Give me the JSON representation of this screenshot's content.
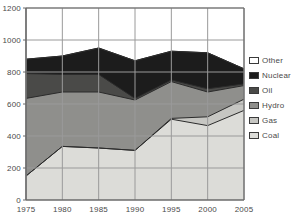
{
  "chart_data": {
    "type": "area",
    "stacked": true,
    "title": "",
    "subtitle": "",
    "xlabel": "",
    "ylabel": "",
    "categories": [
      1975,
      1980,
      1985,
      1990,
      1995,
      2000,
      2005
    ],
    "x_tick_labels": [
      "1975",
      "1980",
      "1985",
      "1990",
      "1995",
      "2000",
      "2005"
    ],
    "y_tick_labels": [
      "0",
      "200",
      "400",
      "600",
      "800",
      "1000",
      "1200"
    ],
    "y_ticks": [
      0,
      200,
      400,
      600,
      800,
      1000,
      1200
    ],
    "ylim": [
      0,
      1200
    ],
    "xlim": [
      1975,
      2005
    ],
    "grid": true,
    "legend_position": "right",
    "series": [
      {
        "name": "Coal",
        "color": "#dcdcd8",
        "values": [
          150,
          335,
          325,
          310,
          505,
          465,
          560
        ]
      },
      {
        "name": "Gas",
        "color": "#c6c6c2",
        "values": [
          0,
          0,
          0,
          0,
          5,
          55,
          70
        ]
      },
      {
        "name": "Hydro",
        "color": "#8f8f8c",
        "values": [
          485,
          340,
          350,
          315,
          230,
          155,
          85
        ]
      },
      {
        "name": "Oil",
        "color": "#4a4a48",
        "values": [
          155,
          110,
          110,
          10,
          10,
          20,
          10
        ]
      },
      {
        "name": "Nuclear",
        "color": "#1c1c1c",
        "values": [
          90,
          115,
          165,
          235,
          180,
          225,
          95
        ]
      },
      {
        "name": "Other",
        "color": "#ffffff",
        "values": [
          0,
          0,
          0,
          0,
          0,
          0,
          0
        ]
      }
    ],
    "cumulative_tops": {
      "Coal": [
        150,
        335,
        325,
        310,
        505,
        465,
        560
      ],
      "Gas": [
        150,
        335,
        325,
        310,
        510,
        520,
        630
      ],
      "Hydro": [
        635,
        675,
        675,
        625,
        740,
        675,
        715
      ],
      "Oil": [
        790,
        785,
        785,
        635,
        750,
        695,
        725
      ],
      "Nuclear": [
        880,
        900,
        950,
        870,
        930,
        920,
        820
      ],
      "Other": [
        880,
        900,
        950,
        870,
        930,
        920,
        820
      ]
    }
  },
  "legend": {
    "items": [
      {
        "label": "Other",
        "color": "#ffffff"
      },
      {
        "label": "Nuclear",
        "color": "#1c1c1c"
      },
      {
        "label": "Oil",
        "color": "#4a4a48"
      },
      {
        "label": "Hydro",
        "color": "#8f8f8c"
      },
      {
        "label": "Gas",
        "color": "#c6c6c2"
      },
      {
        "label": "Coal",
        "color": "#dcdcd8"
      }
    ]
  },
  "axes": {
    "grid_color": "#9a9a9a",
    "axis_color": "#6b6b6b",
    "plot_bg": "#ffffff"
  }
}
